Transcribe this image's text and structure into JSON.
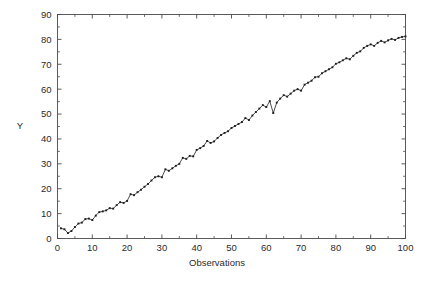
{
  "figure": {
    "background_color": "#ffffff",
    "frame_color": "#4a4a4a",
    "series_color": "#2a2a2a",
    "marker_color": "#1e1e1e",
    "text_color": "#2b2b2b"
  },
  "chart_data": {
    "type": "line",
    "title": "",
    "xlabel": "Observations",
    "ylabel": "Y",
    "xlim": [
      0,
      100
    ],
    "ylim": [
      0,
      90
    ],
    "xticks": [
      0,
      10,
      20,
      30,
      40,
      50,
      60,
      70,
      80,
      90,
      100
    ],
    "xtick_labels": [
      "0",
      "10",
      "20",
      "30",
      "40",
      "50",
      "60",
      "70",
      "80",
      "90",
      "100"
    ],
    "yticks": [
      0,
      10,
      20,
      30,
      40,
      50,
      60,
      70,
      80,
      90
    ],
    "ytick_labels": [
      "0",
      "10",
      "20",
      "30",
      "40",
      "50",
      "60",
      "70",
      "80",
      "90"
    ],
    "x_minor_tick_step": 5,
    "y_minor_tick_step": 5,
    "grid": false,
    "legend": false,
    "legend_position": "none",
    "marker": "filled-square",
    "marker_size": 1.9,
    "line_style": "solid",
    "frame": "box-all-sides",
    "tick_direction": "in",
    "x": [
      1,
      2,
      3,
      4,
      5,
      6,
      7,
      8,
      9,
      10,
      11,
      12,
      13,
      14,
      15,
      16,
      17,
      18,
      19,
      20,
      21,
      22,
      23,
      24,
      25,
      26,
      27,
      28,
      29,
      30,
      31,
      32,
      33,
      34,
      35,
      36,
      37,
      38,
      39,
      40,
      41,
      42,
      43,
      44,
      45,
      46,
      47,
      48,
      49,
      50,
      51,
      52,
      53,
      54,
      55,
      56,
      57,
      58,
      59,
      60,
      61,
      62,
      63,
      64,
      65,
      66,
      67,
      68,
      69,
      70,
      71,
      72,
      73,
      74,
      75,
      76,
      77,
      78,
      79,
      80,
      81,
      82,
      83,
      84,
      85,
      86,
      87,
      88,
      89,
      90,
      91,
      92,
      93,
      94,
      95,
      96,
      97,
      98,
      99,
      100
    ],
    "y": [
      4.1,
      3.7,
      2.2,
      3.0,
      4.6,
      6.0,
      6.4,
      7.8,
      8.0,
      7.4,
      9.2,
      10.6,
      10.9,
      11.3,
      12.2,
      12.0,
      13.4,
      14.6,
      14.3,
      15.1,
      17.8,
      17.4,
      18.6,
      19.6,
      20.8,
      21.9,
      23.3,
      24.6,
      25.0,
      24.6,
      27.8,
      27.2,
      28.2,
      29.2,
      30.0,
      32.4,
      32.0,
      33.2,
      33.0,
      35.6,
      36.3,
      37.2,
      39.2,
      38.4,
      39.0,
      40.4,
      41.6,
      42.4,
      43.1,
      44.4,
      45.2,
      46.0,
      46.8,
      48.4,
      47.6,
      49.4,
      50.8,
      52.2,
      53.6,
      52.8,
      55.2,
      50.4,
      54.6,
      56.2,
      57.6,
      57.0,
      58.2,
      59.4,
      60.0,
      59.4,
      61.8,
      62.6,
      63.4,
      64.8,
      65.0,
      66.4,
      67.2,
      68.0,
      68.8,
      70.2,
      70.8,
      71.6,
      72.4,
      72.0,
      73.4,
      74.6,
      75.2,
      76.6,
      77.4,
      78.0,
      77.4,
      78.6,
      79.4,
      78.8,
      79.6,
      80.2,
      79.8,
      80.6,
      81.0,
      81.2
    ]
  }
}
